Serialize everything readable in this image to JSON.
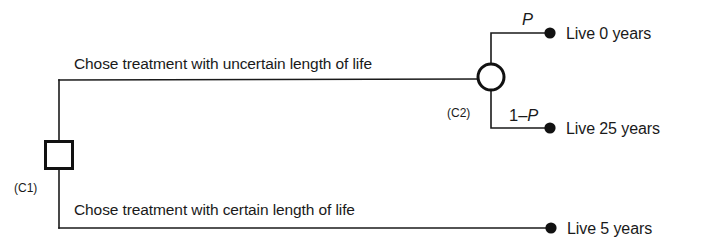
{
  "figure": {
    "type": "decision-tree",
    "colors": {
      "line": "#1a1a1a",
      "node_stroke": "#111111",
      "node_fill": "#ffffff",
      "terminal_dot": "#111111",
      "background": "#ffffff"
    }
  },
  "nodes": {
    "decision": {
      "tag": "(C1)",
      "shape": "square",
      "x": 59,
      "y": 155,
      "size": 27
    },
    "chance": {
      "tag": "(C2)",
      "shape": "circle",
      "x": 491,
      "y": 77,
      "radius": 13
    }
  },
  "branches": {
    "upper": {
      "label": "Chose treatment with uncertain length of life",
      "label_x": 74,
      "label_y": 69
    },
    "lower": {
      "label": "Chose treatment with certain length of life",
      "label_x": 74,
      "label_y": 215
    }
  },
  "probabilities": {
    "upper": {
      "prefix": "",
      "symbol": "P",
      "x": 522,
      "y": 25
    },
    "lower": {
      "prefix": "1–",
      "symbol": "P",
      "x": 509,
      "y": 121
    }
  },
  "outcomes": [
    {
      "id": "live-0-years",
      "label": "Live 0 years",
      "dot_x": 550,
      "dot_y": 33,
      "text_x": 566,
      "text_y": 39
    },
    {
      "id": "live-25-years",
      "label": "Live 25 years",
      "dot_x": 550,
      "dot_y": 128,
      "text_x": 566,
      "text_y": 134
    },
    {
      "id": "live-5-years",
      "label": "Live 5 years",
      "dot_x": 551,
      "dot_y": 228,
      "text_x": 567,
      "text_y": 234
    }
  ],
  "node_tags": {
    "decision_tag_x": 14,
    "decision_tag_y": 192,
    "chance_tag_x": 447,
    "chance_tag_y": 117
  }
}
